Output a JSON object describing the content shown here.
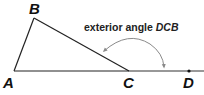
{
  "diagram": {
    "title": "",
    "caption": {
      "text": "exterior angle ",
      "emph": "DCB"
    },
    "points": {
      "A": {
        "label": "A",
        "x": 14,
        "y": 71
      },
      "B": {
        "label": "B",
        "x": 34,
        "y": 18
      },
      "C": {
        "label": "C",
        "x": 129,
        "y": 71
      },
      "D": {
        "label": "D",
        "x": 189,
        "y": 71
      }
    },
    "colors": {
      "lines": "#222222",
      "arc": "#8a8a8a",
      "text": "#111111"
    }
  }
}
